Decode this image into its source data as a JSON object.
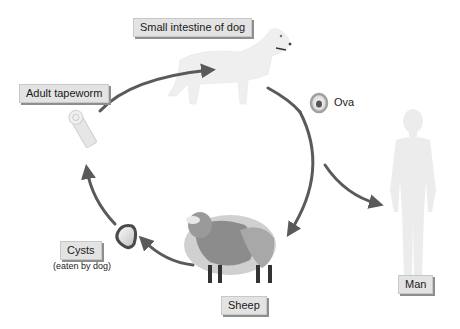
{
  "diagram": {
    "type": "life-cycle",
    "labels": {
      "dog": "Small intestine of dog",
      "adult": "Adult tapeworm",
      "ova": "Ova",
      "cysts": "Cysts",
      "cysts_note": "(eaten by dog)",
      "sheep": "Sheep",
      "man": "Man"
    },
    "colors": {
      "arrow": "#5a5a5a",
      "label_bg": "#e3e3e3",
      "label_shadow": "#8e8e8e",
      "silhouette": "#ececec",
      "sheep_dark": "#8a8a8a",
      "sheep_light": "#d6d6d6"
    },
    "edges": [
      {
        "from": "Adult tapeworm",
        "to": "Small intestine of dog"
      },
      {
        "from": "Small intestine of dog",
        "to": "Ova"
      },
      {
        "from": "Ova",
        "to": "Sheep"
      },
      {
        "from": "Ova",
        "to": "Man"
      },
      {
        "from": "Sheep",
        "to": "Cysts"
      },
      {
        "from": "Cysts",
        "to": "Adult tapeworm"
      }
    ]
  }
}
